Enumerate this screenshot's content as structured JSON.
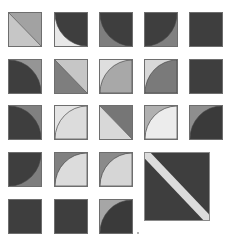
{
  "colors": {
    "dark": "#404040",
    "mid": "#808080",
    "midlight": "#a6a6a6",
    "light": "#d6d6d6",
    "verylight": "#ececec",
    "stripe": "#dcdcdc"
  },
  "tiles": [
    {
      "id": "r1c1",
      "row": 1,
      "col": 1,
      "pattern": "diagonal",
      "fill_a": "#a2a2a2",
      "fill_b": "#c6c6c6"
    },
    {
      "id": "r1c2",
      "row": 1,
      "col": 2,
      "pattern": "arc-topright",
      "inside": "#3e3e3e",
      "outside": "#e8e8e8"
    },
    {
      "id": "r1c3",
      "row": 1,
      "col": 3,
      "pattern": "arc-topright",
      "inside": "#3e3e3e",
      "outside": "#7e7e7e"
    },
    {
      "id": "r1c4",
      "row": 1,
      "col": 4,
      "pattern": "arc-topleft",
      "inside": "#3e3e3e",
      "outside": "#808080"
    },
    {
      "id": "r1c5",
      "row": 1,
      "col": 5,
      "pattern": "solid",
      "fill": "#3e3e3e"
    },
    {
      "id": "r2c1",
      "row": 2,
      "col": 1,
      "pattern": "arc-bottomleft",
      "inside": "#3e3e3e",
      "outside": "#959595"
    },
    {
      "id": "r2c2",
      "row": 2,
      "col": 2,
      "pattern": "diagonal",
      "fill_a": "#c6c6c6",
      "fill_b": "#7e7e7e"
    },
    {
      "id": "r2c3",
      "row": 2,
      "col": 3,
      "pattern": "arc-bottomright",
      "inside": "#a8a8a8",
      "outside": "#dedede"
    },
    {
      "id": "r2c4",
      "row": 2,
      "col": 4,
      "pattern": "arc-bottomright",
      "inside": "#7a7a7a",
      "outside": "#d8d8d8"
    },
    {
      "id": "r2c5",
      "row": 2,
      "col": 5,
      "pattern": "solid",
      "fill": "#3e3e3e"
    },
    {
      "id": "r3c1",
      "row": 3,
      "col": 1,
      "pattern": "arc-bottomleft",
      "inside": "#3e3e3e",
      "outside": "#808080"
    },
    {
      "id": "r3c2",
      "row": 3,
      "col": 2,
      "pattern": "arc-bottomright",
      "inside": "#dcdcdc",
      "outside": "#e4e4e4"
    },
    {
      "id": "r3c3",
      "row": 3,
      "col": 3,
      "pattern": "diagonal",
      "fill_a": "#767676",
      "fill_b": "#d8d8d8"
    },
    {
      "id": "r3c4",
      "row": 3,
      "col": 4,
      "pattern": "arc-bottomright",
      "inside": "#ececec",
      "outside": "#b0b0b0"
    },
    {
      "id": "r3c5",
      "row": 3,
      "col": 5,
      "pattern": "arc-bottomright",
      "inside": "#3a3a3a",
      "outside": "#8e8e8e"
    },
    {
      "id": "r4c1",
      "row": 4,
      "col": 1,
      "pattern": "arc-topleft",
      "inside": "#3e3e3e",
      "outside": "#7e7e7e"
    },
    {
      "id": "r4c2",
      "row": 4,
      "col": 2,
      "pattern": "arc-bottomright",
      "inside": "#dcdcdc",
      "outside": "#808080"
    },
    {
      "id": "r4c3",
      "row": 4,
      "col": 3,
      "pattern": "arc-bottomright",
      "inside": "#d6d6d6",
      "outside": "#8a8a8a"
    },
    {
      "id": "r5c1",
      "row": 5,
      "col": 1,
      "pattern": "solid",
      "fill": "#3e3e3e"
    },
    {
      "id": "r5c2",
      "row": 5,
      "col": 2,
      "pattern": "solid",
      "fill": "#3e3e3e"
    },
    {
      "id": "r5c3",
      "row": 5,
      "col": 3,
      "pattern": "arc-bottomright",
      "inside": "#3a3a3a",
      "outside": "#a6a6a6"
    }
  ],
  "big_tile": {
    "id": "big",
    "pattern": "diagonal-stripe",
    "fill": "#3e3e3e",
    "stripe": "#dcdcdc"
  }
}
